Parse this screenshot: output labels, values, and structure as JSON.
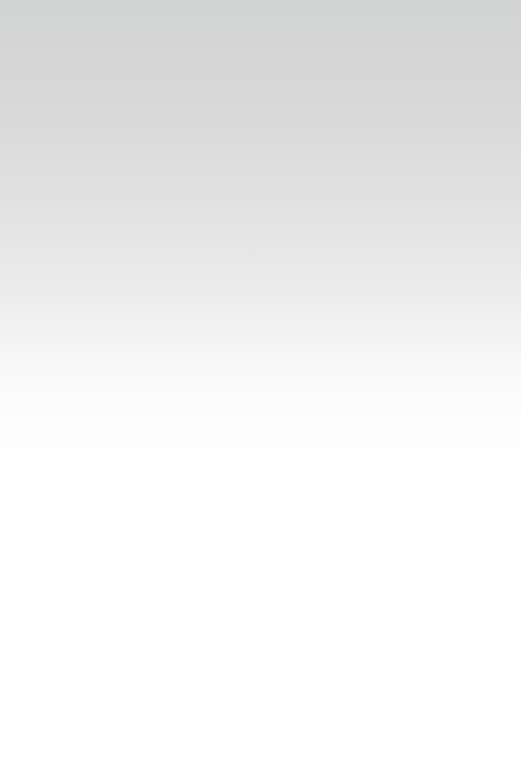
{
  "canvas": {
    "width": 521,
    "height": 776,
    "background_color": "#ffffff",
    "content": ""
  },
  "gradient": {
    "type": "linear",
    "direction": "to bottom",
    "start_color": "#d3d4d4",
    "end_color": "#ffffff",
    "stops": [
      {
        "position_px": 0,
        "position_pct": "0.0%",
        "color": "#d3d4d4"
      },
      {
        "position_px": 100,
        "position_pct": "12.9%",
        "color": "#d9d9d9"
      },
      {
        "position_px": 200,
        "position_pct": "25.8%",
        "color": "#e2e2e2"
      },
      {
        "position_px": 300,
        "position_pct": "38.7%",
        "color": "#eeeeee"
      },
      {
        "position_px": 380,
        "position_pct": "49.0%",
        "color": "#fafafa"
      },
      {
        "position_px": 460,
        "position_pct": "59.3%",
        "color": "#ffffff"
      },
      {
        "position_px": 776,
        "position_pct": "100.0%",
        "color": "#ffffff"
      }
    ]
  },
  "texture": {
    "name": "ordered-dither",
    "visible": true,
    "extent_px": 520,
    "cell_size_px": 2
  }
}
